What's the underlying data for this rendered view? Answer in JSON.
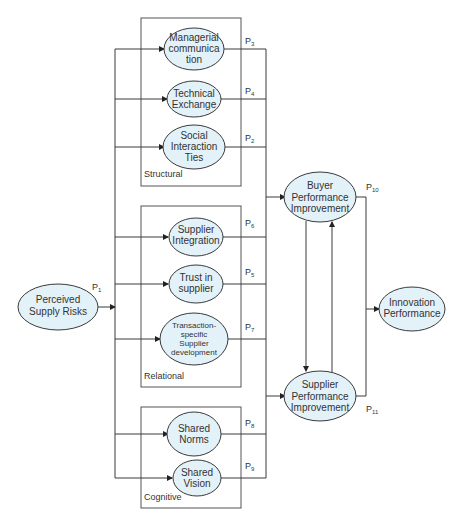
{
  "diagram": {
    "groups": {
      "structural": "Structural",
      "relational": "Relational",
      "cognitive": "Cognitive"
    },
    "nodes": {
      "perceived_supply_risks": [
        "Perceived",
        "Supply Risks"
      ],
      "managerial_communication": [
        "Managerial",
        "communica",
        "tion"
      ],
      "technical_exchange": [
        "Technical",
        "Exchange"
      ],
      "social_interaction_ties": [
        "Social",
        "Interaction",
        "Ties"
      ],
      "supplier_integration": [
        "Supplier",
        "Integration"
      ],
      "trust_in_supplier": [
        "Trust in",
        "supplier"
      ],
      "transaction_specific": [
        "Transaction-",
        "specific",
        "Supplier",
        "development"
      ],
      "shared_norms": [
        "Shared",
        "Norms"
      ],
      "shared_vision": [
        "Shared",
        "Vision"
      ],
      "buyer_performance": [
        "Buyer",
        "Performance",
        "Improvement"
      ],
      "supplier_performance": [
        "Supplier",
        "Performance",
        "Improvement"
      ],
      "innovation_performance": [
        "Innovation",
        "Performance"
      ]
    },
    "paths": {
      "p1": {
        "base": "P",
        "sub": "1"
      },
      "p2": {
        "base": "P",
        "sub": "2"
      },
      "p3": {
        "base": "P",
        "sub": "3"
      },
      "p4": {
        "base": "P",
        "sub": "4"
      },
      "p5": {
        "base": "P",
        "sub": "5"
      },
      "p6": {
        "base": "P",
        "sub": "6"
      },
      "p7": {
        "base": "P",
        "sub": "7"
      },
      "p8": {
        "base": "P",
        "sub": "8"
      },
      "p9": {
        "base": "P",
        "sub": "9"
      },
      "p10": {
        "base": "P",
        "sub": "10"
      },
      "p11": {
        "base": "P",
        "sub": "11"
      }
    },
    "colors": {
      "node_fill": "#e3f1f8",
      "stroke": "#3a3a3a"
    }
  }
}
